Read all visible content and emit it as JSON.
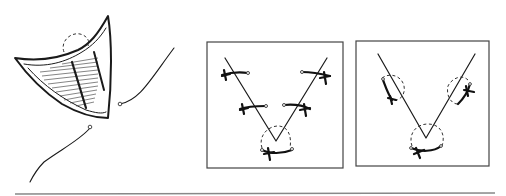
{
  "figure": {
    "panels": [
      {
        "id": "a",
        "description": "V-shaped triangular tissue flap with hatched undersurface, dashed circle at apex, two loose suture strands with needle eyes"
      },
      {
        "id": "b",
        "description": "Framed V-shaped incision closed with five interrupted sutures with knots, dashed circle at apex"
      },
      {
        "id": "c",
        "description": "Framed V-shaped incision with three dashed circles marking suture placements and curved knotted sutures"
      }
    ],
    "colors": {
      "ink": "#1a1a1a",
      "frame": "#444444",
      "rule": "#888888",
      "background": "#ffffff"
    }
  }
}
